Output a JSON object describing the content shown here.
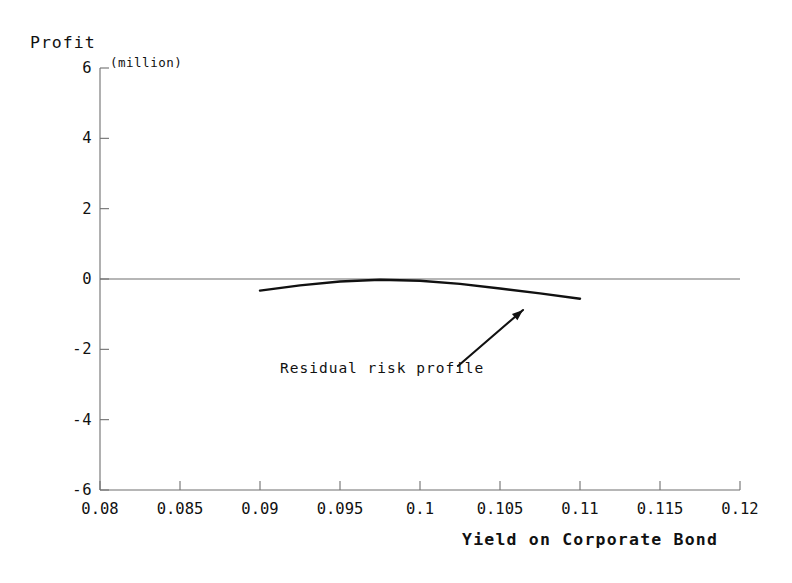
{
  "chart_data": {
    "type": "line",
    "title": "",
    "ylabel": "Profit",
    "yunit": "(million)",
    "xlabel": "Yield on Corporate Bond",
    "xlim": [
      0.08,
      0.12
    ],
    "ylim": [
      -6,
      6
    ],
    "grid": false,
    "legend": "none",
    "xticks": [
      "0.08",
      "0.085",
      "0.09",
      "0.095",
      "0.1",
      "0.105",
      "0.11",
      "0.115",
      "0.12"
    ],
    "xtick_values": [
      0.08,
      0.085,
      0.09,
      0.095,
      0.1,
      0.105,
      0.11,
      0.115,
      0.12
    ],
    "yticks": [
      "6",
      "4",
      "2",
      "0",
      "-2",
      "-4",
      "-6"
    ],
    "ytick_values": [
      6,
      4,
      2,
      0,
      -2,
      -4,
      -6
    ],
    "zero_line": 0,
    "series": [
      {
        "name": "Residual risk profile",
        "x": [
          0.09,
          0.0925,
          0.095,
          0.0975,
          0.1,
          0.1025,
          0.105,
          0.1075,
          0.11
        ],
        "y": [
          -0.33,
          -0.18,
          -0.07,
          -0.02,
          -0.05,
          -0.14,
          -0.27,
          -0.41,
          -0.56
        ]
      }
    ],
    "annotations": [
      {
        "text": "Residual risk profile",
        "points_to_x": 0.1068,
        "points_to_y": -0.45
      }
    ]
  },
  "axes": {
    "y_title": "Profit",
    "y_unit": "(million)",
    "x_title": "Yield on Corporate Bond"
  },
  "annotation": {
    "label": "Residual risk profile"
  },
  "colors": {
    "curve": "#111111",
    "axis": "#6f6f6f",
    "background": "#ffffff"
  }
}
